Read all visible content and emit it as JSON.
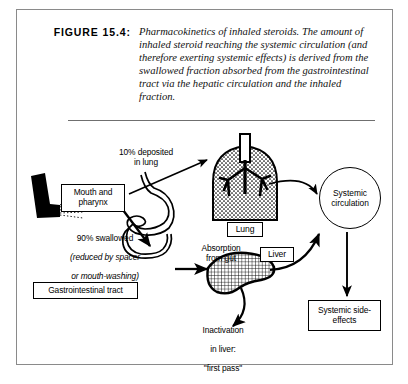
{
  "figure": {
    "label": "FIGURE 15.4:",
    "caption": "Pharmacokinetics of inhaled steroids. The amount of inhaled steroid reaching the systemic circulation (and therefore exerting systemic effects) is derived from the swallowed fraction absorbed from the gastrointestinal tract via the hepatic circulation and the inhaled fraction."
  },
  "diagram": {
    "boxes": {
      "mouth_pharynx": "Mouth and\npharynx",
      "lung": "Lung",
      "liver": "Liver",
      "gastrointestinal_tract": "Gastrointestinal tract",
      "systemic_side_effects": "Systemic\nside-effects",
      "systemic_circulation": "Systemic\ncirculation"
    },
    "labels": {
      "deposited_in_lung": "10% deposited\nin lung",
      "swallowed_line1": "90% swallowed",
      "swallowed_line2": "(reduced by spacer",
      "swallowed_line3": "or mouth-washing)",
      "absorption_from_gut": "Absorption\nfrom gut",
      "inactivation_line1": "Inactivation",
      "inactivation_line2": "in liver:",
      "inactivation_line3": "\"first pass\""
    },
    "icons": {
      "inhaler": "inhaler-icon",
      "lung_organ": "lung-organ-icon",
      "liver_organ": "liver-organ-icon",
      "stomach_organ": "stomach-gi-tract-icon"
    }
  },
  "colors": {
    "ink": "#000000",
    "border": "#8a8a8a",
    "rule": "#6f6f6f",
    "paper": "#ffffff"
  }
}
